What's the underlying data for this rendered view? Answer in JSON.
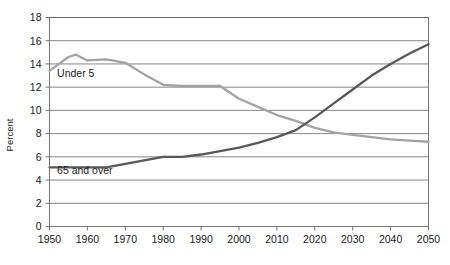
{
  "chart_data": {
    "type": "line",
    "title": "",
    "xlabel": "",
    "ylabel": "Percent",
    "xlim": [
      1950,
      2050
    ],
    "ylim": [
      0,
      18
    ],
    "ytick_step": 2,
    "xtick_step": 10,
    "grid": true,
    "legend_position": "inline-annotation",
    "xticks": [
      "1950",
      "1960",
      "1970",
      "1980",
      "1990",
      "2000",
      "2010",
      "2020",
      "2030",
      "2040",
      "2050"
    ],
    "yticks": [
      "0",
      "2",
      "4",
      "6",
      "8",
      "10",
      "12",
      "14",
      "16",
      "18"
    ],
    "series": [
      {
        "name": "Under 5",
        "color": "#a3a3a3",
        "label_x": 1952,
        "label_y": 12.9,
        "x": [
          1950,
          1955,
          1957,
          1960,
          1965,
          1970,
          1975,
          1980,
          1985,
          1990,
          1995,
          2000,
          2005,
          2010,
          2015,
          2020,
          2025,
          2030,
          2035,
          2040,
          2045,
          2050
        ],
        "values": [
          13.4,
          14.6,
          14.8,
          14.3,
          14.4,
          14.1,
          13.1,
          12.2,
          12.1,
          12.1,
          12.1,
          11.0,
          10.3,
          9.6,
          9.1,
          8.5,
          8.1,
          7.9,
          7.7,
          7.5,
          7.4,
          7.3
        ]
      },
      {
        "name": "65 and over",
        "color": "#585858",
        "label_x": 1952,
        "label_y": 4.5,
        "x": [
          1950,
          1955,
          1960,
          1965,
          1970,
          1975,
          1980,
          1985,
          1990,
          1995,
          2000,
          2005,
          2010,
          2015,
          2020,
          2025,
          2030,
          2035,
          2040,
          2045,
          2050
        ],
        "values": [
          5.1,
          5.1,
          5.1,
          5.1,
          5.4,
          5.7,
          6.0,
          6.0,
          6.2,
          6.5,
          6.8,
          7.2,
          7.7,
          8.3,
          9.4,
          10.6,
          11.8,
          13.0,
          14.0,
          14.9,
          15.7
        ]
      }
    ]
  },
  "axis": {
    "ylabel": "Percent"
  }
}
